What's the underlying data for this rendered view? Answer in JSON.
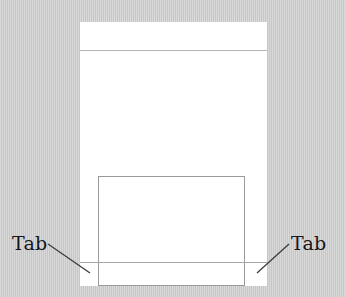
{
  "figure": {
    "background_color": "#c9c9c9",
    "sheet_color": "#ffffff",
    "line_color": "#9a9a9a",
    "label_color": "#15151a"
  },
  "page_sheet": {
    "name": "document-page",
    "header_rule": "",
    "footer_rule": ""
  },
  "content_box": {
    "name": "content-frame",
    "text": ""
  },
  "callouts": [
    {
      "id": "left",
      "label": "Tab",
      "leader": {
        "x1": 48,
        "y1": 244,
        "x2": 90,
        "y2": 273
      }
    },
    {
      "id": "right",
      "label": "Tab",
      "leader": {
        "x1": 289,
        "y1": 244,
        "x2": 257,
        "y2": 273
      }
    }
  ]
}
